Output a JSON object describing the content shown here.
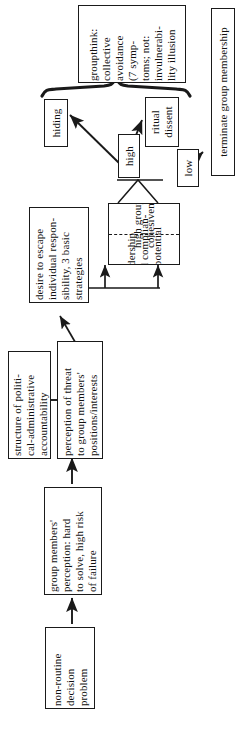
{
  "diagram": {
    "orientation": "rotated-90-ccw",
    "stroke_color": "#1a1a1a",
    "background_color": "#ffffff",
    "nodes": [
      {
        "id": "groupthink",
        "name": "groupthink-box",
        "text": "groupthink:\ncollective\navoidance\n(7 symp-\ntoms; not:\ninvulnerabi-\nlity illusion"
      },
      {
        "id": "terminate",
        "name": "terminate-group-membership-box",
        "text": "terminate group membership"
      },
      {
        "id": "hiding",
        "name": "hiding-box",
        "text": "hiding"
      },
      {
        "id": "ritual_dissent",
        "name": "ritual-dissent-box",
        "text": "ritual\ndissent"
      },
      {
        "id": "high",
        "name": "high-box",
        "text": "high"
      },
      {
        "id": "low",
        "name": "low-box",
        "text": "low"
      },
      {
        "id": "cohesion_left",
        "name": "high-group-cohesiveness-box",
        "text": "high group\ncohesiveness"
      },
      {
        "id": "cohesion_right",
        "name": "leadership-compliance-potential-box",
        "text": "leadership\nand complian-\nce potential"
      },
      {
        "id": "desire_escape",
        "name": "desire-to-escape-responsibility-box",
        "text": "desire to escape\nindividual respon-\nsibility, 3 basic\nstrategies"
      },
      {
        "id": "structure",
        "name": "structure-of-accountability-box",
        "text": "structure of politi-\ncal-administrative\naccountability"
      },
      {
        "id": "threat",
        "name": "perception-of-threat-box",
        "text": "perception of threat\nto group members'\npositions/interests"
      },
      {
        "id": "perception",
        "name": "group-members-perception-box",
        "text": "group members'\nperception: hard\nto solve, high risk\nof failure"
      },
      {
        "id": "problem",
        "name": "non-routine-decision-problem-box",
        "text": "non-routine\ndecision\nproblem"
      }
    ]
  }
}
